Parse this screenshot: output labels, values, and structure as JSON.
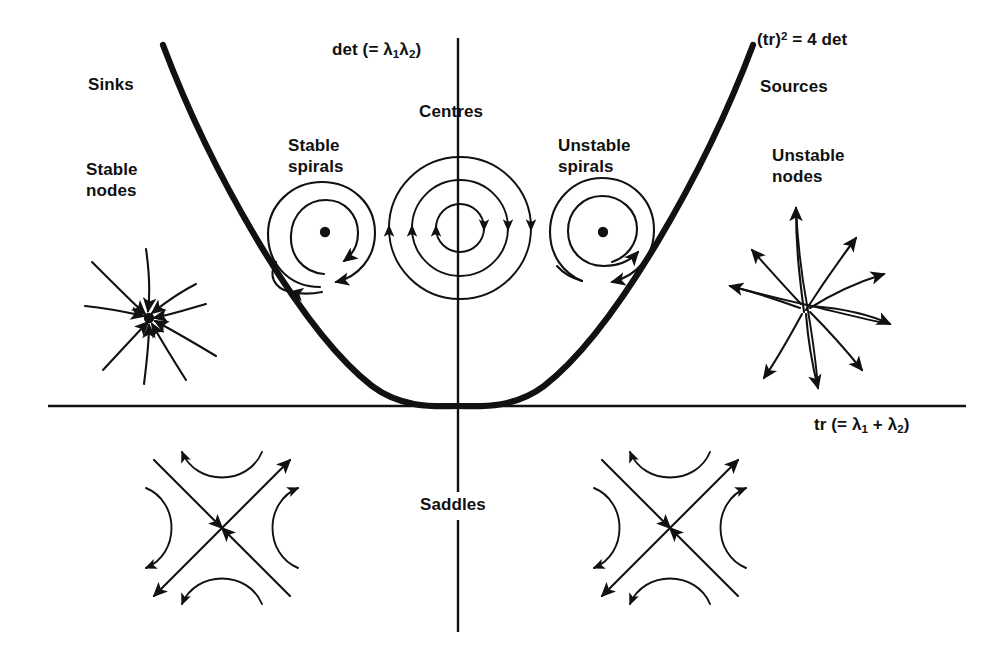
{
  "figure": {
    "background_color": "#ffffff",
    "ink_color": "#111111",
    "width": 994,
    "height": 658
  },
  "axes": {
    "vertical_label": "det (= λ₁λ₂)",
    "vertical_label_parts": {
      "pre": "det (= ",
      "sym1": "λ",
      "sub1": "1",
      "sym2": "λ",
      "sub2": "2",
      "post": ")"
    },
    "horizontal_label": "tr (= λ₁ + λ₂)",
    "horizontal_label_parts": {
      "pre": "tr (= ",
      "sym1": "λ",
      "sub1": "1",
      "mid": " + ",
      "sym2": "λ",
      "sub2": "2",
      "post": ")"
    },
    "origin_x": 458,
    "origin_y": 406
  },
  "curve": {
    "label": "(tr)² = 4 det",
    "label_parts": {
      "base": "(tr)",
      "exp": "2",
      "rest": " = 4 det"
    },
    "equation": "(tr)^2 = 4 det",
    "vertex": [
      458,
      406
    ]
  },
  "regions": [
    {
      "key": "sinks",
      "label": "Sinks",
      "x": 88,
      "y": 75
    },
    {
      "key": "stable-nodes",
      "label": "Stable\nnodes",
      "line1": "Stable",
      "line2": "nodes",
      "x": 86,
      "y": 160
    },
    {
      "key": "stable-spirals",
      "label": "Stable\nspirals",
      "line1": "Stable",
      "line2": "spirals",
      "x": 288,
      "y": 136
    },
    {
      "key": "centres",
      "label": "Centres",
      "x": 419,
      "y": 102
    },
    {
      "key": "unstable-spirals",
      "label": "Unstable\nspirals",
      "line1": "Unstable",
      "line2": "spirals",
      "x": 558,
      "y": 136
    },
    {
      "key": "sources",
      "label": "Sources",
      "x": 760,
      "y": 77
    },
    {
      "key": "unstable-nodes",
      "label": "Unstable\nnodes",
      "line1": "Unstable",
      "line2": "nodes",
      "x": 772,
      "y": 146
    },
    {
      "key": "saddles",
      "label": "Saddles",
      "x": 420,
      "y": 505
    }
  ],
  "phase_portraits": [
    {
      "key": "stable-node-portrait",
      "type": "stable node",
      "center": [
        148,
        318
      ],
      "arrow_direction": "inward",
      "rays": 9
    },
    {
      "key": "stable-spiral-portrait",
      "type": "stable spiral",
      "center": [
        325,
        232
      ],
      "arrow_direction": "inward"
    },
    {
      "key": "centre-portrait",
      "type": "centre",
      "center": [
        460,
        228
      ],
      "arrow_direction": "closed orbits",
      "orbits": 3
    },
    {
      "key": "unstable-spiral-portrait",
      "type": "unstable spiral",
      "center": [
        603,
        232
      ],
      "arrow_direction": "outward"
    },
    {
      "key": "unstable-node-portrait",
      "type": "unstable node",
      "center": [
        807,
        305
      ],
      "arrow_direction": "outward",
      "rays": 9
    },
    {
      "key": "saddle-left-portrait",
      "type": "saddle",
      "center": [
        222,
        528
      ]
    },
    {
      "key": "saddle-right-portrait",
      "type": "saddle",
      "center": [
        670,
        528
      ]
    }
  ]
}
